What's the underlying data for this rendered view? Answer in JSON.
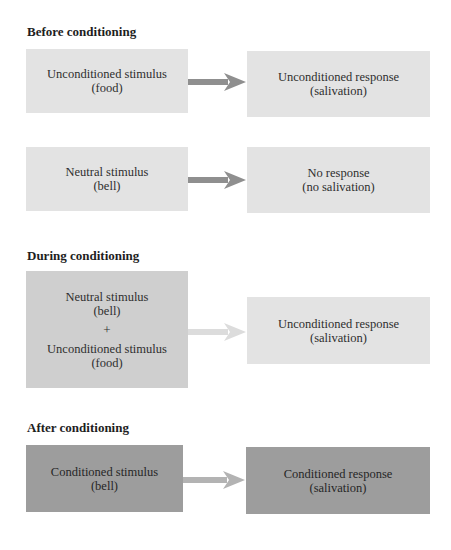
{
  "sections": [
    {
      "heading": "Before conditioning",
      "rows": [
        {
          "stimulus": {
            "line1": "Unconditioned stimulus",
            "line2": "(food)"
          },
          "response": {
            "line1": "Unconditioned response",
            "line2": "(salivation)"
          },
          "arrow_color": "#8f8f8f"
        },
        {
          "stimulus": {
            "line1": "Neutral stimulus",
            "line2": "(bell)"
          },
          "response": {
            "line1": "No response",
            "line2": "(no salivation)"
          },
          "arrow_color": "#8f8f8f"
        }
      ]
    },
    {
      "heading": "During conditioning",
      "rows": [
        {
          "stimulus": {
            "line1": "Neutral stimulus",
            "line2": "(bell)",
            "plus": "+",
            "line3": "Unconditioned stimulus",
            "line4": "(food)"
          },
          "response": {
            "line1": "Unconditioned response",
            "line2": "(salivation)"
          },
          "arrow_color": "#dcdcdc"
        }
      ]
    },
    {
      "heading": "After conditioning",
      "rows": [
        {
          "stimulus": {
            "line1": "Conditioned stimulus",
            "line2": "(bell)"
          },
          "response": {
            "line1": "Conditioned response",
            "line2": "(salivation)"
          },
          "arrow_color": "#b3b3b3"
        }
      ]
    }
  ],
  "colors": {
    "box_light": "#e3e3e3",
    "box_mid": "#cfcfcf",
    "box_dark": "#9d9d9d",
    "arrow_dark": "#8f8f8f",
    "arrow_light": "#dcdcdc",
    "arrow_mid": "#b3b3b3"
  }
}
